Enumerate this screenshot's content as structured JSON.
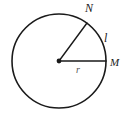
{
  "figure": {
    "type": "circle-sector-diagram",
    "background_color": "#ffffff",
    "stroke_color": "#1a1a1a",
    "labels": {
      "point_n": "N",
      "point_m": "M",
      "arc_length": "l",
      "radius": "r"
    },
    "geometry": {
      "center": {
        "x": 59,
        "y": 61
      },
      "radius_px": 47,
      "center_dot_radius_px": 2.4,
      "circle_stroke_width": 1.6,
      "radius_stroke_width": 1.4,
      "radius_n_endpoint": {
        "x": 87,
        "y": 23
      },
      "radius_m_endpoint": {
        "x": 106,
        "y": 61
      }
    }
  }
}
